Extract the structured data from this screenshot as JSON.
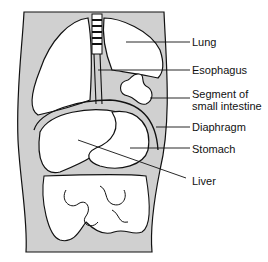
{
  "diagram": {
    "labels": [
      {
        "id": "lung",
        "text": "Lung",
        "x": 192,
        "y": 36
      },
      {
        "id": "esophagus",
        "text": "Esophagus",
        "x": 192,
        "y": 64
      },
      {
        "id": "small-intestine",
        "text": "Segment of\nsmall intestine",
        "line1": "Segment of",
        "line2": "small intestine",
        "x": 192,
        "y": 88
      },
      {
        "id": "diaphragm",
        "text": "Diaphragm",
        "x": 192,
        "y": 121
      },
      {
        "id": "stomach",
        "text": "Stomach",
        "x": 192,
        "y": 143
      },
      {
        "id": "liver",
        "text": "Liver",
        "x": 192,
        "y": 175
      }
    ],
    "colors": {
      "body": "#d0d0d0",
      "organ": "#ffffff",
      "outline": "#111111"
    }
  }
}
